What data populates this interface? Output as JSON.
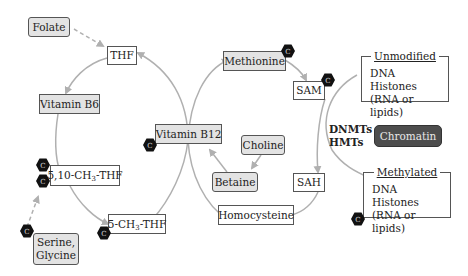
{
  "nodes": {
    "folate": "Folate",
    "thf": "THF",
    "vitamin_b6": "Vitamin B6",
    "methyl_thf_510_prefix": "5,10-CH",
    "methyl_thf_510_sub": "3",
    "methyl_thf_510_suffix": "-THF",
    "methyl_thf_5_prefix": "5-CH",
    "methyl_thf_5_sub": "3",
    "methyl_thf_5_suffix": "-THF",
    "serine_glycine_line1": "Serine,",
    "serine_glycine_line2": "Glycine",
    "vitamin_b12": "Vitamin B12",
    "methionine": "Methionine",
    "sam": "SAM",
    "sah": "SAH",
    "choline": "Choline",
    "betaine": "Betaine",
    "homocysteine": "Homocysteine",
    "chromatin": "Chromatin"
  },
  "enzymes": {
    "line1": "DNMTs",
    "line2": "HMTs"
  },
  "groups": {
    "unmodified": {
      "title": "Unmodified",
      "items": [
        "DNA",
        "Histones",
        "(RNA or lipids)"
      ]
    },
    "methylated": {
      "title": "Methylated",
      "items": [
        "DNA",
        "Histones",
        "(RNA or lipids)"
      ]
    }
  },
  "badge": {
    "label": "C"
  },
  "colors": {
    "arrow": "#b0b0b0",
    "gray_fill": "#e3e3e3",
    "chromatin_fill": "#4d4d4d",
    "badge_fill": "#111111"
  }
}
